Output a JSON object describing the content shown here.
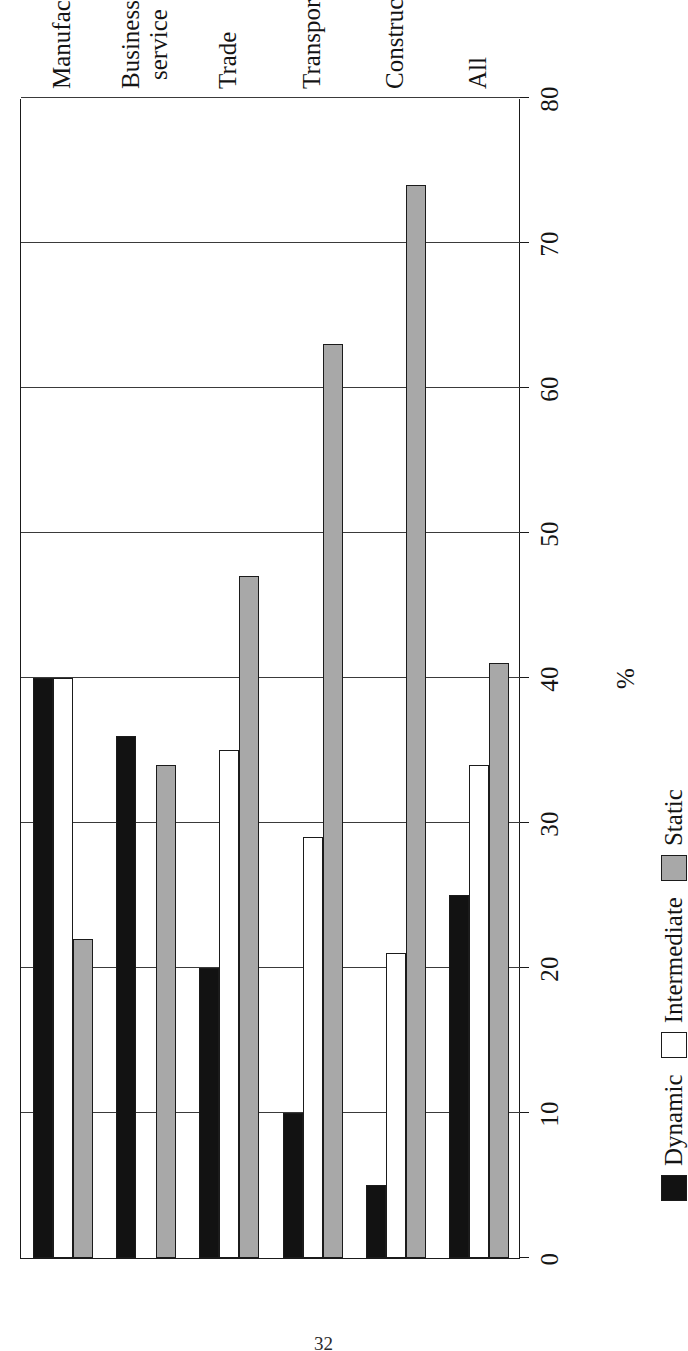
{
  "page": {
    "number": "32"
  },
  "chart_data": {
    "type": "bar",
    "orientation": "horizontal",
    "title": "",
    "xlabel": "",
    "ylabel": "%",
    "axis_title": "%",
    "ylim": [
      0,
      80
    ],
    "tick_values": [
      0,
      10,
      20,
      30,
      40,
      50,
      60,
      70,
      80
    ],
    "tick_labels": [
      "0",
      "10",
      "20",
      "30",
      "40",
      "50",
      "60",
      "70",
      "80"
    ],
    "grid": true,
    "legend_position": "bottom-right",
    "categories": [
      "Manufacturing",
      "Business\nservice",
      "Trade",
      "Transport",
      "Construction",
      "All"
    ],
    "series": [
      {
        "name": "Dynamic",
        "color": "#121212",
        "values": [
          40,
          36,
          20,
          10,
          5,
          25
        ]
      },
      {
        "name": "Intermediate",
        "color": "#ffffff",
        "values": [
          40,
          0,
          35,
          29,
          21,
          34
        ]
      },
      {
        "name": "Static",
        "color": "#a8a8a8",
        "values": [
          22,
          34,
          47,
          63,
          74,
          41
        ]
      }
    ]
  }
}
